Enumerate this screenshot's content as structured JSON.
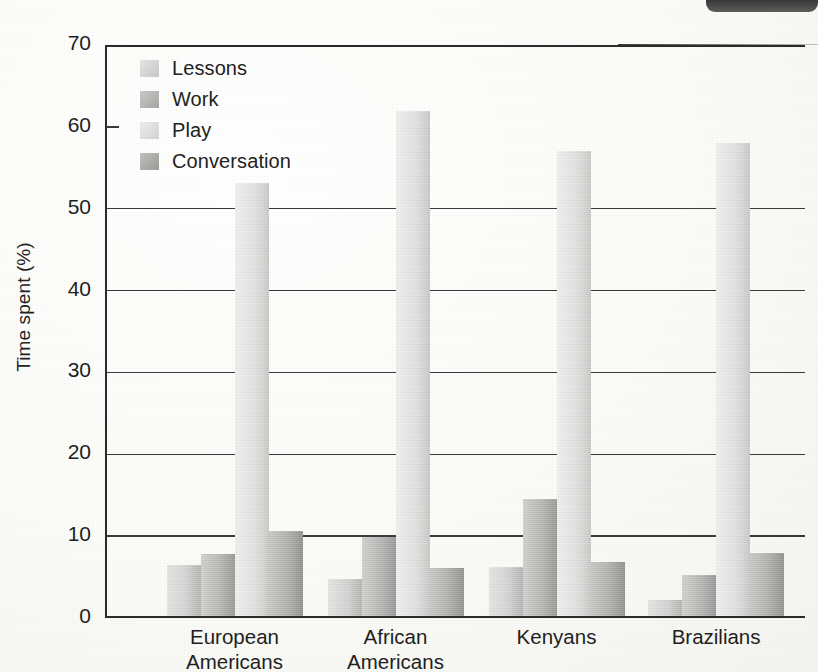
{
  "chart_data": {
    "type": "bar",
    "title": "",
    "xlabel": "",
    "ylabel": "Time spent (%)",
    "ylim": [
      0,
      70
    ],
    "ytick_values": [
      0,
      10,
      20,
      30,
      40,
      50,
      60,
      70
    ],
    "ytick_labels": [
      "0",
      "10",
      "20",
      "30",
      "40",
      "50",
      "60",
      "70"
    ],
    "grid": "horizontal",
    "legend_position": "top-left inside plot",
    "categories": [
      "European Americans",
      "African Americans",
      "Kenyans",
      "Brazilians"
    ],
    "category_lines": [
      [
        "European",
        "Americans"
      ],
      [
        "African",
        "Americans"
      ],
      [
        "Kenyans",
        ""
      ],
      [
        "Brazilians",
        ""
      ]
    ],
    "series": [
      {
        "name": "Lessons",
        "color": "#d6d6d5",
        "values": [
          6.3,
          4.6,
          6.0,
          2.0
        ]
      },
      {
        "name": "Work",
        "color": "#b8b8b6",
        "values": [
          7.6,
          9.7,
          14.3,
          5.0
        ]
      },
      {
        "name": "Play",
        "color": "#e2e2e1",
        "values": [
          53.0,
          61.7,
          56.8,
          57.8
        ]
      },
      {
        "name": "Conversation",
        "color": "#b0b0ae",
        "values": [
          10.4,
          5.9,
          6.7,
          7.8
        ]
      }
    ]
  },
  "figure": {
    "background_color": "#fdfdfb",
    "axis_color": "#2b2b2b",
    "text_color": "#1f1f1f",
    "artifact": "scan-shadow-top-right"
  }
}
